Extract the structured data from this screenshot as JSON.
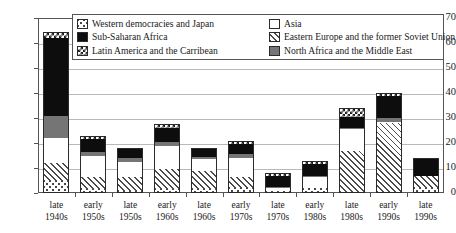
{
  "chart_data": {
    "type": "bar",
    "stacked": true,
    "title": "",
    "xlabel": "",
    "ylabel": "",
    "ylim": [
      0,
      70
    ],
    "yticks": [
      0,
      10,
      20,
      30,
      40,
      50,
      60,
      70
    ],
    "grid": true,
    "legend_position": "top-center",
    "categories": [
      "late\n1940s",
      "early\n1950s",
      "late\n1950s",
      "early\n1960s",
      "late\n1960s",
      "early\n1970s",
      "late\n1970s",
      "early\n1980s",
      "late\n1980s",
      "early\n1990s",
      "late\n1990s"
    ],
    "category_lines": [
      [
        "late",
        "1940s"
      ],
      [
        "early",
        "1950s"
      ],
      [
        "late",
        "1950s"
      ],
      [
        "early",
        "1960s"
      ],
      [
        "late",
        "1960s"
      ],
      [
        "early",
        "1970s"
      ],
      [
        "late",
        "1970s"
      ],
      [
        "early",
        "1980s"
      ],
      [
        "late",
        "1980s"
      ],
      [
        "early",
        "1990s"
      ],
      [
        "late",
        "1990s"
      ]
    ],
    "series": [
      {
        "name": "Western democracies and Japan",
        "key": "west",
        "fill": "dotted",
        "values": [
          5,
          1.5,
          1,
          1.5,
          1.5,
          2,
          0.5,
          1.5,
          0.5,
          0.5,
          2
        ]
      },
      {
        "name": "Eastern Europe and the former Soviet Union",
        "key": "east",
        "fill": "diagonal-hatch",
        "values": [
          7,
          5,
          5.5,
          8,
          7.5,
          4.5,
          0.5,
          0.5,
          16.5,
          27.5,
          5
        ]
      },
      {
        "name": "Asia",
        "key": "asia",
        "fill": "white",
        "values": [
          10,
          8.5,
          6,
          9.5,
          4.5,
          7.5,
          1,
          4.5,
          8.5,
          0.5,
          0
        ]
      },
      {
        "name": "North Africa and the Middle East",
        "key": "north",
        "fill": "solid-gray",
        "values": [
          9,
          1.5,
          1.5,
          1.5,
          1,
          1.5,
          0.5,
          0.5,
          0.5,
          1.5,
          0
        ]
      },
      {
        "name": "Sub-Saharan Africa",
        "key": "sub",
        "fill": "solid-black",
        "values": [
          31,
          5,
          3.5,
          5.5,
          3,
          4,
          4.5,
          4.5,
          4.5,
          9,
          7
        ]
      },
      {
        "name": "Latin America and the Carribean",
        "key": "latin",
        "fill": "checker",
        "values": [
          2.5,
          1.5,
          0.5,
          1.5,
          0.5,
          1.5,
          1,
          1.5,
          3.5,
          1,
          0
        ]
      }
    ],
    "totals": [
      64.5,
      23,
      18,
      27.5,
      18,
      21,
      8,
      13,
      34,
      40,
      14
    ]
  },
  "legend": {
    "items_left": [
      {
        "label": "Western democracies and Japan",
        "key": "west"
      },
      {
        "label": "Sub-Saharan Africa",
        "key": "sub"
      },
      {
        "label": "Latin America and the Carribean",
        "key": "latin"
      }
    ],
    "items_right": [
      {
        "label": "Asia",
        "key": "asia"
      },
      {
        "label": "Eastern Europe and the former Soviet Union",
        "key": "east"
      },
      {
        "label": "North Africa and the Middle East",
        "key": "north"
      }
    ]
  },
  "colors": {
    "black": "#0d0d0d",
    "gray": "#757575",
    "white": "#ffffff",
    "axis": "#555555",
    "grid": "#b9b9b9"
  }
}
